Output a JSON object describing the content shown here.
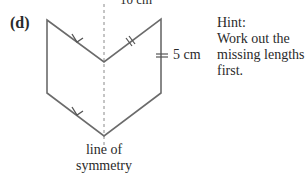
{
  "problem": {
    "part_label": "(d)",
    "top_dimension_label": "10 cm",
    "side_dimension_label": "5 cm",
    "hint": {
      "title": "Hint:",
      "lines": [
        "Work out the",
        "missing lengths",
        "first."
      ]
    },
    "symmetry_label": {
      "line1": "line of",
      "line2": "symmetry"
    }
  },
  "shape": {
    "type": "arrow-hexagon",
    "stroke_color": "#6b6b6b",
    "vertices": [
      [
        47,
        20
      ],
      [
        104,
        62
      ],
      [
        161,
        19
      ],
      [
        161,
        93
      ],
      [
        104,
        136
      ],
      [
        47,
        93
      ]
    ],
    "markings": {
      "parallel_arrows_on": [
        "top-left edge",
        "bottom-left edge"
      ],
      "equal_tick_marks_on": [
        "top-right edge",
        "right vertical edge"
      ]
    },
    "symmetry_line": {
      "x": 104,
      "style": "dashed"
    }
  }
}
